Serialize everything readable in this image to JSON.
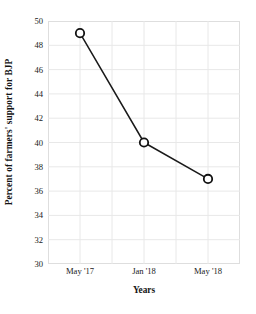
{
  "chart_data": {
    "type": "line",
    "title": "",
    "xlabel": "Years",
    "ylabel": "Percent of farmers' support for BJP",
    "categories": [
      "May '17",
      "Jan '18",
      "May '18"
    ],
    "values": [
      49,
      40,
      37
    ],
    "series": [
      {
        "name": "Percent of farmers' support for BJP",
        "values": [
          49,
          40,
          37
        ]
      }
    ],
    "points": [
      {
        "x": "May '17",
        "y": 49
      },
      {
        "x": "Jan '18",
        "y": 40
      },
      {
        "x": "May '18",
        "y": 37
      }
    ],
    "ylim": [
      30,
      50
    ],
    "yticks": [
      30,
      32,
      34,
      36,
      38,
      40,
      42,
      44,
      46,
      48,
      50
    ],
    "ytick_labels": [
      "30",
      "32",
      "34",
      "36",
      "38",
      "40",
      "42",
      "44",
      "46",
      "48",
      "50"
    ],
    "xtick_labels": [
      "May '17",
      "Jan '18",
      "May '18"
    ],
    "grid": true,
    "legend": null,
    "annotations": [],
    "colors": {
      "line": "#1a1a1a",
      "marker_fill": "#ffffff",
      "marker_edge": "#111111",
      "grid": "#e8e8e8",
      "axis_border": "#dedede",
      "background": "#ffffff",
      "text": "#1a1a1a"
    },
    "marker": "open-circle",
    "x_gridline_count": 5
  }
}
